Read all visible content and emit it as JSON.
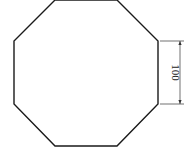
{
  "diagram": {
    "shape": "regular-octagon",
    "stroke_color": "#1a1a1a",
    "dimension_color": "#333333",
    "vertices": [
      [
        55,
        0
      ],
      [
        117,
        0
      ],
      [
        158,
        41
      ],
      [
        158,
        104
      ],
      [
        117,
        146
      ],
      [
        55,
        146
      ],
      [
        14,
        104
      ],
      [
        14,
        41
      ]
    ],
    "dimension": {
      "label": "100",
      "side": "right",
      "from_y": 41,
      "to_y": 104,
      "line_x": 180,
      "ext_x1": 160,
      "ext_x2": 184
    }
  }
}
